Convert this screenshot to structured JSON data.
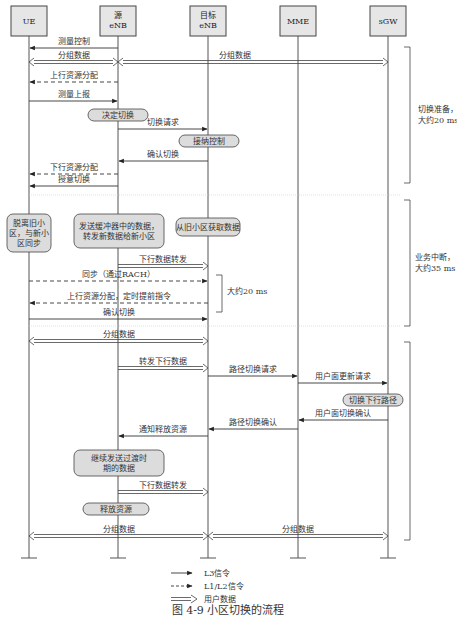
{
  "diagram": {
    "participants": [
      {
        "id": "ue",
        "label": [
          "UE"
        ],
        "x": 29
      },
      {
        "id": "src",
        "label": [
          "源",
          "eNB"
        ],
        "x": 118
      },
      {
        "id": "tgt",
        "label": [
          "目标",
          "eNB"
        ],
        "x": 208
      },
      {
        "id": "mme",
        "label": [
          "MME"
        ],
        "x": 298
      },
      {
        "id": "sgw",
        "label": [
          "sGW"
        ],
        "x": 388
      }
    ],
    "messages": [
      {
        "from": "src",
        "to": "ue",
        "y": 48,
        "type": "solid",
        "label": "测量控制"
      },
      {
        "from": "ue",
        "to": "src",
        "y": 62,
        "type": "data-both",
        "label": "分组数据"
      },
      {
        "from": "src",
        "to": "sgw",
        "y": 62,
        "type": "data-both",
        "label": "分组数据",
        "label_x": 235
      },
      {
        "from": "src",
        "to": "ue",
        "y": 82,
        "type": "dashed",
        "label": "上行资源分配"
      },
      {
        "from": "ue",
        "to": "src",
        "y": 101,
        "type": "solid",
        "label": "测量上报"
      },
      {
        "from": "src",
        "to": "tgt",
        "y": 129,
        "type": "solid",
        "label": "切换请求"
      },
      {
        "from": "tgt",
        "to": "src",
        "y": 161,
        "type": "solid",
        "label": "确认切换"
      },
      {
        "from": "src",
        "to": "ue",
        "y": 174,
        "type": "dashed",
        "label": "下行资源分配"
      },
      {
        "from": "src",
        "to": "ue",
        "y": 186,
        "type": "solid",
        "label": "授意切换"
      },
      {
        "from": "src",
        "to": "tgt",
        "y": 266,
        "type": "data",
        "label": "下行数据转发"
      },
      {
        "from": "ue",
        "to": "tgt",
        "y": 281,
        "type": "dashed",
        "label": "同步（通过RACH）"
      },
      {
        "from": "tgt",
        "to": "ue",
        "y": 303,
        "type": "dashed",
        "label": "上行资源分配，定时提前指令"
      },
      {
        "from": "ue",
        "to": "tgt",
        "y": 319,
        "type": "solid",
        "label": "确认切换"
      },
      {
        "from": "ue",
        "to": "tgt",
        "y": 341,
        "type": "data-both",
        "label": "分组数据"
      },
      {
        "from": "src",
        "to": "tgt",
        "y": 368,
        "type": "data",
        "label": "转发下行数据"
      },
      {
        "from": "tgt",
        "to": "mme",
        "y": 376,
        "type": "solid",
        "label": "路径切换请求"
      },
      {
        "from": "mme",
        "to": "sgw",
        "y": 383,
        "type": "solid",
        "label": "用户面更新请求"
      },
      {
        "from": "sgw",
        "to": "mme",
        "y": 420,
        "type": "solid",
        "label": "用户面切换确认"
      },
      {
        "from": "mme",
        "to": "tgt",
        "y": 429,
        "type": "solid",
        "label": "路径切换确认"
      },
      {
        "from": "tgt",
        "to": "src",
        "y": 436,
        "type": "solid",
        "label": "通知释放资源"
      },
      {
        "from": "src",
        "to": "tgt",
        "y": 492,
        "type": "data",
        "label": "下行数据转发"
      },
      {
        "from": "ue",
        "to": "tgt",
        "y": 536,
        "type": "data-both",
        "label": "分组数据"
      },
      {
        "from": "tgt",
        "to": "sgw",
        "y": 536,
        "type": "data-both",
        "label": "分组数据"
      }
    ],
    "actions": [
      {
        "label": [
          "决定切换"
        ],
        "x": 88,
        "y": 109,
        "w": 60,
        "h": 12
      },
      {
        "label": [
          "接纳控制"
        ],
        "x": 179,
        "y": 135,
        "w": 60,
        "h": 12
      },
      {
        "label": [
          "脱离旧小",
          "区，与新小",
          "区同步"
        ],
        "x": 7,
        "y": 214,
        "w": 44,
        "h": 38
      },
      {
        "label": [
          "发送缓冲器中的数据，",
          "转发新数据给新小区"
        ],
        "x": 74,
        "y": 214,
        "w": 90,
        "h": 34
      },
      {
        "label": [
          "从旧小区获取数据"
        ],
        "x": 176,
        "y": 218,
        "w": 64,
        "h": 18
      },
      {
        "label": [
          "切换下行路径"
        ],
        "x": 343,
        "y": 394,
        "w": 60,
        "h": 12
      },
      {
        "label": [
          "继续发送过渡时",
          "期的数据"
        ],
        "x": 74,
        "y": 450,
        "w": 90,
        "h": 26
      },
      {
        "label": [
          "释放资源"
        ],
        "x": 83,
        "y": 503,
        "w": 66,
        "h": 12
      }
    ],
    "brackets": [
      {
        "y1": 47,
        "y2": 183,
        "x": 410,
        "label": [
          "切换准备，",
          "大约20 ms"
        ],
        "label_x": 418,
        "label_y": 112
      },
      {
        "y1": 200,
        "y2": 326,
        "x": 410,
        "label": [
          "业务中断，",
          "大约35 ms"
        ],
        "label_x": 415,
        "label_y": 260
      },
      {
        "y1": 275,
        "y2": 312,
        "x": 222,
        "label": [
          "大约20 ms"
        ],
        "label_x": 227,
        "label_y": 294
      },
      {
        "y1": 342,
        "y2": 540,
        "x": 410,
        "label": [],
        "label_x": 0,
        "label_y": 0
      }
    ],
    "separators": [
      195,
      326
    ]
  },
  "legend": {
    "items": [
      {
        "type": "solid",
        "label": "L3信令"
      },
      {
        "type": "dashed",
        "label": "L1/L2信令"
      },
      {
        "type": "data",
        "label": "用户数据"
      }
    ]
  },
  "caption": "图 4-9    小区切换的流程"
}
